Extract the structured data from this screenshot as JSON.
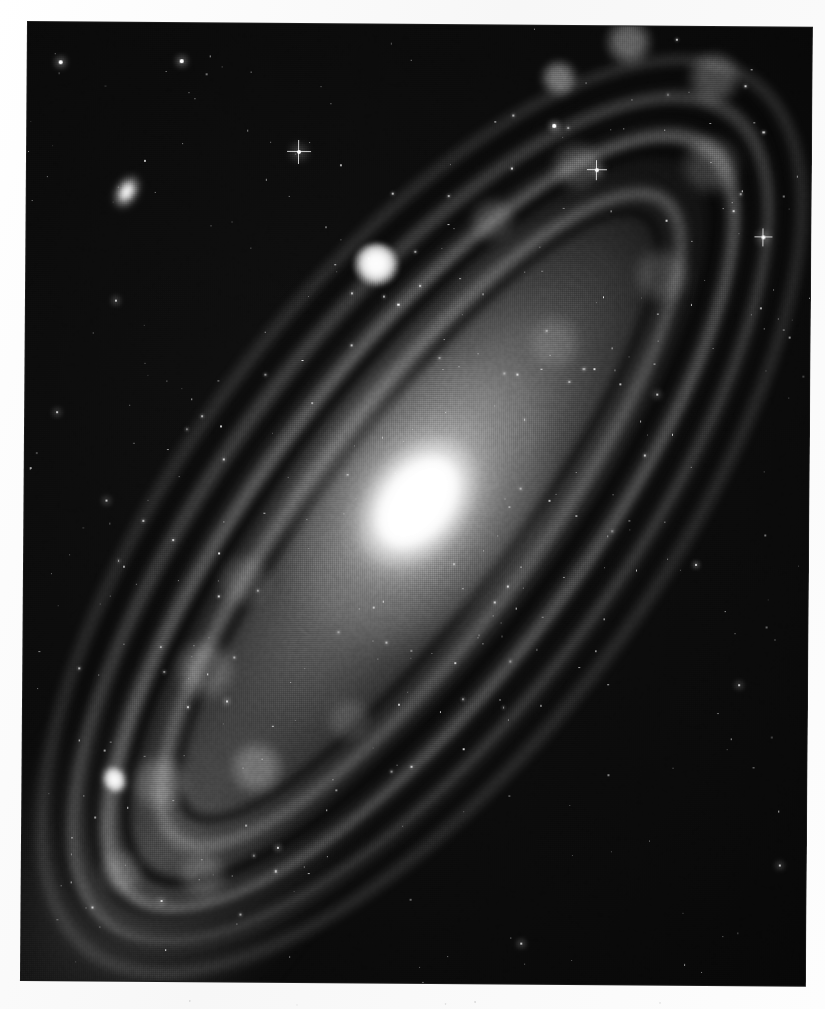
{
  "page": {
    "background_color": "#fbfbfb",
    "kind": "scanned-halftone-photographic-plate"
  },
  "plate": {
    "name": "andromeda-galaxy-plate",
    "background_color": "#070707",
    "left": 28,
    "top": 22,
    "width": 784,
    "height": 958,
    "rotation_deg": 0.42
  },
  "caption": {
    "text": "",
    "visible": false
  },
  "objects": [
    {
      "id": "m31-core",
      "label": "M31 nucleus",
      "x": 382,
      "y": 508,
      "kind": "galactic-nucleus"
    },
    {
      "id": "m32",
      "label": "M32 companion",
      "x": 378,
      "y": 262,
      "kind": "companion-galaxy"
    },
    {
      "id": "m110",
      "label": "M110 companion",
      "x": 120,
      "y": 779,
      "kind": "companion-galaxy"
    },
    {
      "id": "ne-knot",
      "label": "NE star cloud knot",
      "x": 128,
      "y": 191,
      "kind": "star-cloud"
    }
  ],
  "galaxy": {
    "name": "Andromeda Galaxy",
    "major_axis_angle_deg": 37,
    "disk_length_px": 1120,
    "disk_width_px": 470,
    "dust_lane_count": 4,
    "spiral_arm_count": 4
  },
  "stars": {
    "bright": [
      {
        "x": 300,
        "y": 150,
        "r": 2.6,
        "spikes": true
      },
      {
        "x": 598,
        "y": 166,
        "r": 2.2,
        "spikes": true
      },
      {
        "x": 765,
        "y": 232,
        "r": 2.0,
        "spikes": true
      },
      {
        "x": 555,
        "y": 122,
        "r": 1.6,
        "spikes": false
      },
      {
        "x": 61,
        "y": 62,
        "r": 1.8,
        "spikes": false
      },
      {
        "x": 182,
        "y": 60,
        "r": 1.7,
        "spikes": false
      },
      {
        "x": 118,
        "y": 300,
        "r": 1.5,
        "spikes": false
      },
      {
        "x": 60,
        "y": 412,
        "r": 1.4,
        "spikes": false
      },
      {
        "x": 110,
        "y": 500,
        "r": 1.4,
        "spikes": false
      },
      {
        "x": 232,
        "y": 700,
        "r": 1.3,
        "spikes": false
      },
      {
        "x": 660,
        "y": 390,
        "r": 1.4,
        "spikes": false
      },
      {
        "x": 700,
        "y": 560,
        "r": 1.3,
        "spikes": false
      },
      {
        "x": 744,
        "y": 680,
        "r": 1.4,
        "spikes": false
      },
      {
        "x": 528,
        "y": 940,
        "r": 1.5,
        "spikes": false
      },
      {
        "x": 168,
        "y": 900,
        "r": 1.4,
        "spikes": false
      },
      {
        "x": 284,
        "y": 846,
        "r": 1.3,
        "spikes": false
      },
      {
        "x": 786,
        "y": 860,
        "r": 1.4,
        "spikes": false
      }
    ],
    "field_count": 420
  },
  "tone": {
    "paper": "#fbfbfb",
    "sky": "#070707",
    "highlight": "#ffffff",
    "dust": "#040404",
    "arm": "#c8c8c8"
  }
}
